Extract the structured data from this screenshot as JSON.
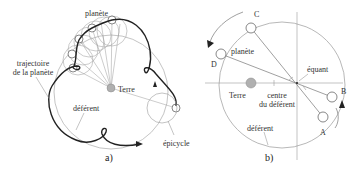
{
  "diagram_a": {
    "caption": "a)",
    "labels": {
      "planet": "planète",
      "trajectory_line1": "trajectoire",
      "trajectory_line2": "de la planète",
      "earth": "Terre",
      "deferent": "déférent",
      "epicycle": "épicycle"
    }
  },
  "diagram_b": {
    "caption": "b)",
    "labels": {
      "point_c": "C",
      "point_d": "D",
      "point_b": "B",
      "point_a": "A",
      "planet": "planète",
      "equant": "équant",
      "earth": "Terre",
      "center_line1": "centre",
      "center_line2": "du déférent",
      "deferent": "déférent"
    }
  },
  "colors": {
    "thin_line": "#9a9a9a",
    "thick_line": "#222222",
    "earth_fill": "#b0b0b0",
    "text": "#333333"
  }
}
